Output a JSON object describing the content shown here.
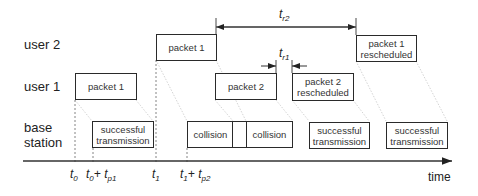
{
  "diagram": {
    "rows": {
      "user2": "user 2",
      "user1": "user 1",
      "base_station_line1": "base",
      "base_station_line2": "station"
    },
    "user2_boxes": [
      {
        "label": "packet 1"
      },
      {
        "label_line1": "packet 1",
        "label_line2": "rescheduled"
      }
    ],
    "user1_boxes": [
      {
        "label": "packet 1"
      },
      {
        "label": "packet 2"
      },
      {
        "label_line1": "packet 2",
        "label_line2": "rescheduled"
      }
    ],
    "base_station_boxes": [
      {
        "label_line1": "successful",
        "label_line2": "transmission"
      },
      {
        "label": "collision"
      },
      {
        "label": "collision"
      },
      {
        "label_line1": "successful",
        "label_line2": "transmission"
      },
      {
        "label_line1": "successful",
        "label_line2": "transmission"
      }
    ],
    "intervals": {
      "tr2": {
        "base": "t",
        "sub": "r2"
      },
      "tr1": {
        "base": "t",
        "sub": "r1"
      }
    },
    "axis": {
      "label": "time",
      "ticks": [
        {
          "base": "t",
          "sub": "0",
          "plus": "",
          "base2": "",
          "sub2": ""
        },
        {
          "base": "t",
          "sub": "0",
          "plus": "+ ",
          "base2": "t",
          "sub2": "p1"
        },
        {
          "base": "t",
          "sub": "1",
          "plus": "",
          "base2": "",
          "sub2": ""
        },
        {
          "base": "t",
          "sub": "1",
          "plus": "+ ",
          "base2": "t",
          "sub2": "p2"
        }
      ]
    }
  }
}
